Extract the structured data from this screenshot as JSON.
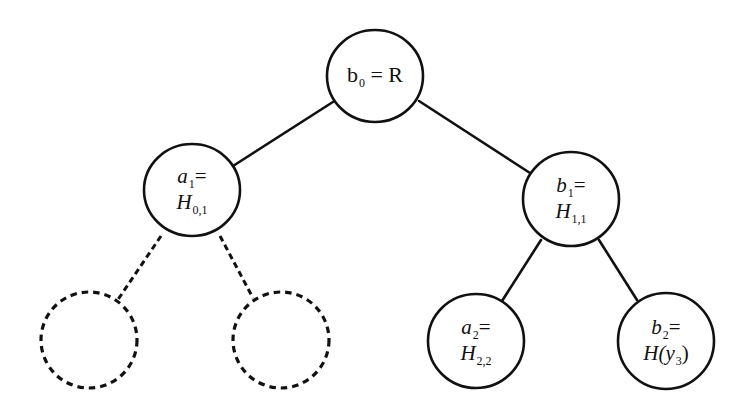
{
  "diagram": {
    "type": "binary-tree",
    "background": "#ffffff",
    "stroke_color": "#111111",
    "nodes": [
      {
        "id": "root",
        "style": "solid",
        "cx": 375,
        "cy": 76,
        "rx": 48,
        "ry": 46,
        "label": {
          "var": "b",
          "sub": "0",
          "eq": " = ",
          "rhs": "R",
          "rhs_sub": ""
        }
      },
      {
        "id": "a1",
        "style": "solid",
        "cx": 192,
        "cy": 190,
        "rx": 48,
        "ry": 46,
        "label": {
          "line1_var": "a",
          "line1_sub": "1",
          "line1_eq": "=",
          "line2_var": "H",
          "line2_sub": "0,1",
          "line2_rest": ""
        }
      },
      {
        "id": "b1",
        "style": "solid",
        "cx": 571,
        "cy": 199,
        "rx": 48,
        "ry": 47,
        "label": {
          "line1_var": "b",
          "line1_sub": "1",
          "line1_eq": "=",
          "line2_var": "H",
          "line2_sub": "1,1",
          "line2_rest": ""
        }
      },
      {
        "id": "dashed-left",
        "style": "dashed",
        "cx": 89,
        "cy": 340,
        "rx": 48,
        "ry": 48,
        "label": null
      },
      {
        "id": "dashed-right",
        "style": "dashed",
        "cx": 281,
        "cy": 340,
        "rx": 48,
        "ry": 48,
        "label": null
      },
      {
        "id": "a2",
        "style": "solid",
        "cx": 476,
        "cy": 341,
        "rx": 48,
        "ry": 47,
        "label": {
          "line1_var": "a",
          "line1_sub": "2",
          "line1_eq": "=",
          "line2_var": "H",
          "line2_sub": "2,2",
          "line2_rest": ""
        }
      },
      {
        "id": "b2",
        "style": "solid",
        "cx": 666,
        "cy": 341,
        "rx": 48,
        "ry": 48,
        "label": {
          "line1_var": "b",
          "line1_sub": "2",
          "line1_eq": "=",
          "line2_var": "H(y",
          "line2_sub": "3",
          "line2_rest": ")"
        }
      }
    ],
    "edges": [
      {
        "from": "root",
        "to": "a1",
        "style": "solid",
        "x1": 336,
        "y1": 100,
        "x2": 233,
        "y2": 166
      },
      {
        "from": "root",
        "to": "b1",
        "style": "solid",
        "x1": 419,
        "y1": 101,
        "x2": 530,
        "y2": 173
      },
      {
        "from": "a1",
        "to": "dashed-left",
        "style": "dashed",
        "x1": 161,
        "y1": 236,
        "x2": 117,
        "y2": 301
      },
      {
        "from": "a1",
        "to": "dashed-right",
        "style": "dashed",
        "x1": 220,
        "y1": 236,
        "x2": 253,
        "y2": 298
      },
      {
        "from": "b1",
        "to": "a2",
        "style": "solid",
        "x1": 541,
        "y1": 240,
        "x2": 502,
        "y2": 301
      },
      {
        "from": "b1",
        "to": "b2",
        "style": "solid",
        "x1": 599,
        "y1": 240,
        "x2": 637,
        "y2": 300
      }
    ]
  }
}
